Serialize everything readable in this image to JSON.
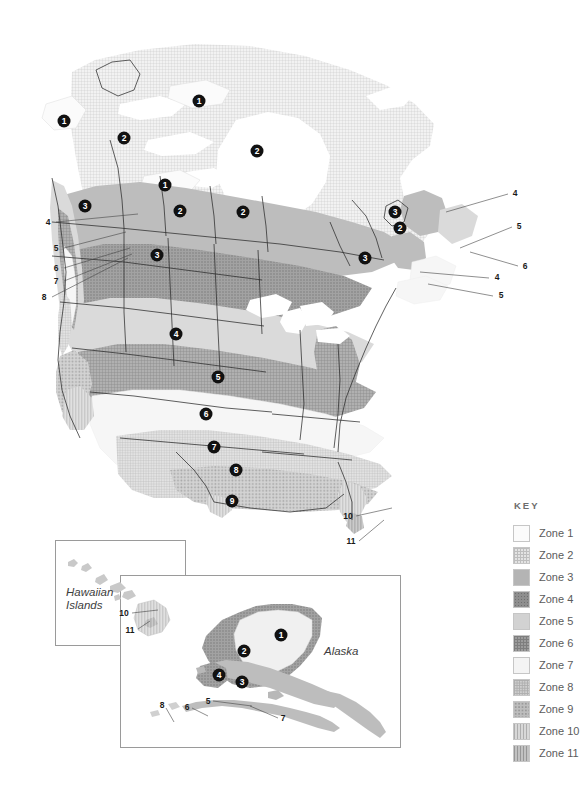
{
  "legend": {
    "title": "KEY",
    "items": [
      {
        "label": "Zone 1",
        "pattern": "solid-white",
        "color": "#fbfbfb"
      },
      {
        "label": "Zone 2",
        "pattern": "fine-grid",
        "color": "#e3e3e3"
      },
      {
        "label": "Zone 3",
        "pattern": "solid-midgray",
        "color": "#b4b4b4"
      },
      {
        "label": "Zone 4",
        "pattern": "dense-dot",
        "color": "#8e8e8e"
      },
      {
        "label": "Zone 5",
        "pattern": "solid-lightgray",
        "color": "#d2d2d2"
      },
      {
        "label": "Zone 6",
        "pattern": "cross-hatch",
        "color": "#9c9c9c"
      },
      {
        "label": "Zone 7",
        "pattern": "solid-offwhite",
        "color": "#f4f4f4"
      },
      {
        "label": "Zone 8",
        "pattern": "fine-crosshatch",
        "color": "#cfcfcf"
      },
      {
        "label": "Zone 9",
        "pattern": "coarse-dot",
        "color": "#bdbdbd"
      },
      {
        "label": "Zone 10",
        "pattern": "vertical-line",
        "color": "#d8d8d8"
      },
      {
        "label": "Zone 11",
        "pattern": "vertical-band",
        "color": "#c2c2c2"
      }
    ]
  },
  "insets": {
    "hawaii": {
      "title": "Hawaiian\nIslands"
    },
    "alaska": {
      "title": "Alaska"
    }
  },
  "main_map": {
    "zone_markers": [
      {
        "zone": "1",
        "x": 64,
        "y": 121
      },
      {
        "zone": "1",
        "x": 199,
        "y": 101
      },
      {
        "zone": "2",
        "x": 124,
        "y": 138
      },
      {
        "zone": "2",
        "x": 257,
        "y": 151
      },
      {
        "zone": "1",
        "x": 165,
        "y": 185
      },
      {
        "zone": "3",
        "x": 85,
        "y": 206
      },
      {
        "zone": "2",
        "x": 180,
        "y": 211
      },
      {
        "zone": "2",
        "x": 243,
        "y": 212
      },
      {
        "zone": "3",
        "x": 395,
        "y": 212
      },
      {
        "zone": "2",
        "x": 400,
        "y": 228
      },
      {
        "zone": "3",
        "x": 157,
        "y": 255
      },
      {
        "zone": "3",
        "x": 365,
        "y": 258
      },
      {
        "zone": "4",
        "x": 176,
        "y": 334
      },
      {
        "zone": "5",
        "x": 218,
        "y": 377
      },
      {
        "zone": "6",
        "x": 206,
        "y": 414
      },
      {
        "zone": "7",
        "x": 214,
        "y": 447
      },
      {
        "zone": "8",
        "x": 236,
        "y": 470
      },
      {
        "zone": "9",
        "x": 232,
        "y": 501
      }
    ],
    "leader_labels": [
      {
        "text": "4",
        "x": 48,
        "y": 222
      },
      {
        "text": "5",
        "x": 56,
        "y": 248
      },
      {
        "text": "6",
        "x": 56,
        "y": 268
      },
      {
        "text": "7",
        "x": 56,
        "y": 281
      },
      {
        "text": "8",
        "x": 44,
        "y": 297
      },
      {
        "text": "4",
        "x": 515,
        "y": 193
      },
      {
        "text": "5",
        "x": 519,
        "y": 226
      },
      {
        "text": "6",
        "x": 525,
        "y": 266
      },
      {
        "text": "4",
        "x": 497,
        "y": 277
      },
      {
        "text": "5",
        "x": 501,
        "y": 295
      },
      {
        "text": "10",
        "x": 348,
        "y": 516
      },
      {
        "text": "11",
        "x": 351,
        "y": 541
      }
    ]
  },
  "hawaii_map": {
    "leader_labels": [
      {
        "text": "10",
        "x": 124,
        "y": 613
      },
      {
        "text": "11",
        "x": 130,
        "y": 630
      }
    ]
  },
  "alaska_map": {
    "zone_markers": [
      {
        "zone": "1",
        "x": 281,
        "y": 635
      },
      {
        "zone": "2",
        "x": 244,
        "y": 651
      },
      {
        "zone": "4",
        "x": 219,
        "y": 675
      },
      {
        "zone": "3",
        "x": 242,
        "y": 682
      }
    ],
    "leader_labels": [
      {
        "text": "5",
        "x": 208,
        "y": 701
      },
      {
        "text": "6",
        "x": 187,
        "y": 707
      },
      {
        "text": "7",
        "x": 283,
        "y": 718
      },
      {
        "text": "8",
        "x": 162,
        "y": 705
      }
    ]
  }
}
